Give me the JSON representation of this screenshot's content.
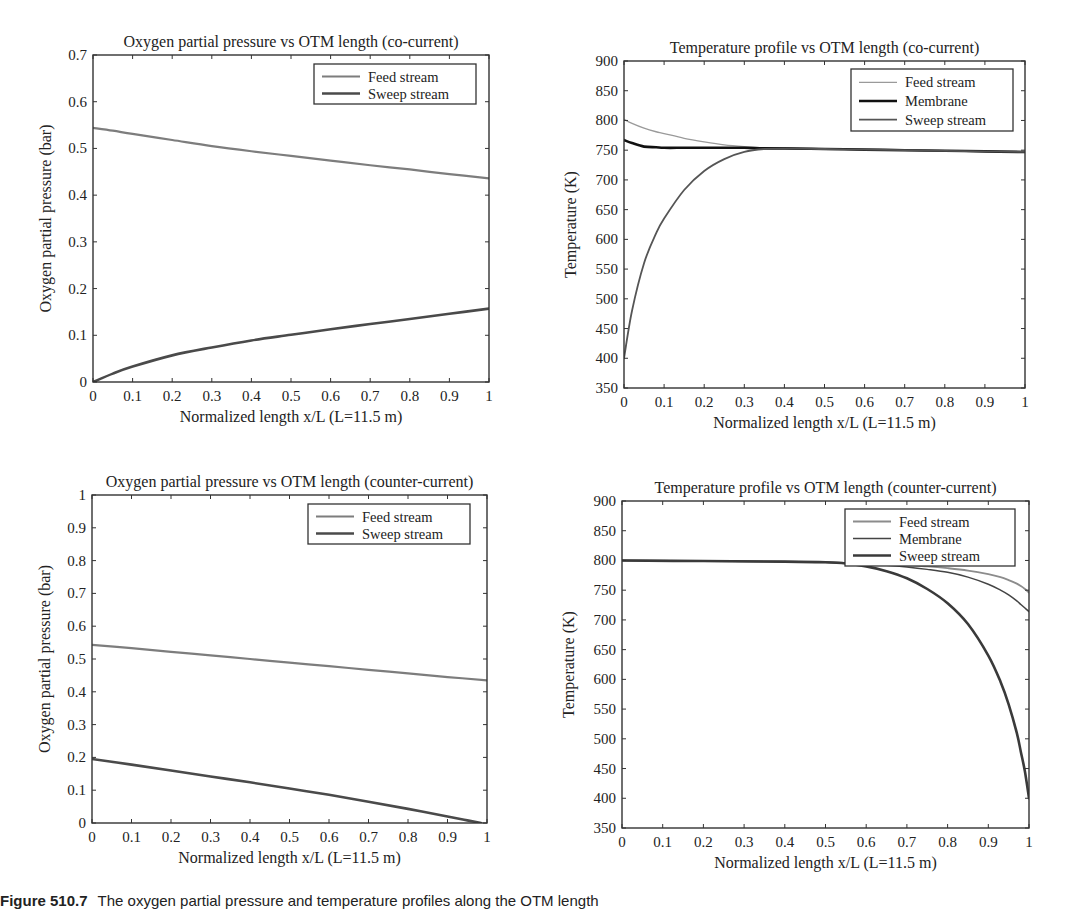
{
  "figure": {
    "caption_label": "Figure 510.7",
    "caption_text": "The oxygen partial pressure and temperature profiles along the OTM length"
  },
  "chart_data": [
    {
      "id": "o2-cocurrent",
      "type": "line",
      "title": "Oxygen partial pressure vs OTM length (co-current)",
      "xlabel": "Normalized length x/L (L=11.5 m)",
      "ylabel": "Oxygen partial pressure (bar)",
      "xlim": [
        0,
        1
      ],
      "ylim": [
        0,
        0.7
      ],
      "xticks": [
        0,
        0.1,
        0.2,
        0.3,
        0.4,
        0.5,
        0.6,
        0.7,
        0.8,
        0.9,
        1
      ],
      "xtick_labels": [
        "0",
        "0.1",
        "0.2",
        "0.3",
        "0.4",
        "0.5",
        "0.6",
        "0.7",
        "0.8",
        "0.9",
        "1"
      ],
      "yticks": [
        0,
        0.1,
        0.2,
        0.3,
        0.4,
        0.5,
        0.6,
        0.7
      ],
      "ytick_labels": [
        "0",
        "0.1",
        "0.2",
        "0.3",
        "0.4",
        "0.5",
        "0.6",
        "0.7"
      ],
      "grid": false,
      "legend_position": "upper right",
      "box": {
        "left": 93,
        "top": 55,
        "right": 489,
        "bottom": 382
      },
      "legend": {
        "x": 314,
        "y": 64,
        "w": 162,
        "h": 40
      },
      "x": [
        0,
        0.05,
        0.1,
        0.2,
        0.3,
        0.4,
        0.5,
        0.6,
        0.7,
        0.8,
        0.9,
        1
      ],
      "series": [
        {
          "name": "Feed stream",
          "color": "#7d7d7d",
          "width": 2.2,
          "values": [
            0.544,
            0.538,
            0.531,
            0.518,
            0.505,
            0.494,
            0.484,
            0.474,
            0.464,
            0.455,
            0.445,
            0.436
          ]
        },
        {
          "name": "Sweep stream",
          "color": "#4a4a4a",
          "width": 2.6,
          "values": [
            0.0,
            0.018,
            0.033,
            0.057,
            0.074,
            0.089,
            0.101,
            0.113,
            0.124,
            0.135,
            0.146,
            0.157
          ]
        }
      ]
    },
    {
      "id": "temp-cocurrent",
      "type": "line",
      "title": "Temperature profile vs OTM length (co-current)",
      "xlabel": "Normalized length x/L (L=11.5 m)",
      "ylabel": "Temperature (K)",
      "xlim": [
        0,
        1
      ],
      "ylim": [
        350,
        900
      ],
      "xticks": [
        0,
        0.1,
        0.2,
        0.3,
        0.4,
        0.5,
        0.6,
        0.7,
        0.8,
        0.9,
        1
      ],
      "xtick_labels": [
        "0",
        "0.1",
        "0.2",
        "0.3",
        "0.4",
        "0.5",
        "0.6",
        "0.7",
        "0.8",
        "0.9",
        "1"
      ],
      "yticks": [
        350,
        400,
        450,
        500,
        550,
        600,
        650,
        700,
        750,
        800,
        850,
        900
      ],
      "ytick_labels": [
        "350",
        "400",
        "450",
        "500",
        "550",
        "600",
        "650",
        "700",
        "750",
        "800",
        "850",
        "900"
      ],
      "grid": false,
      "legend_position": "upper right",
      "box": {
        "left": 624,
        "top": 61,
        "right": 1025,
        "bottom": 388
      },
      "legend": {
        "x": 851,
        "y": 69,
        "w": 162,
        "h": 62
      },
      "x": [
        0,
        0.02,
        0.05,
        0.08,
        0.1,
        0.15,
        0.2,
        0.25,
        0.3,
        0.35,
        0.4,
        0.5,
        0.6,
        0.7,
        0.8,
        0.9,
        1
      ],
      "series": [
        {
          "name": "Feed stream",
          "color": "#9a9a9a",
          "width": 1.3,
          "values": [
            802,
            795,
            787,
            781,
            778,
            770,
            764,
            759,
            756,
            754,
            753,
            752,
            751,
            750,
            749,
            748,
            747
          ]
        },
        {
          "name": "Membrane",
          "color": "#111111",
          "width": 2.6,
          "values": [
            767,
            762,
            756,
            755,
            754,
            754,
            754,
            754,
            754,
            753,
            753,
            752,
            751,
            750,
            749,
            748,
            747
          ]
        },
        {
          "name": "Sweep stream",
          "color": "#555555",
          "width": 1.8,
          "values": [
            400,
            480,
            560,
            610,
            635,
            683,
            715,
            735,
            747,
            752,
            753,
            752,
            751,
            750,
            749,
            748,
            747
          ]
        }
      ]
    },
    {
      "id": "o2-countercurrent",
      "type": "line",
      "title": "Oxygen partial pressure vs OTM length (counter-current)",
      "xlabel": "Normalized length x/L (L=11.5 m)",
      "ylabel": "Oxygen partial pressure (bar)",
      "xlim": [
        0,
        1
      ],
      "ylim": [
        0,
        1
      ],
      "xticks": [
        0,
        0.1,
        0.2,
        0.3,
        0.4,
        0.5,
        0.6,
        0.7,
        0.8,
        0.9,
        1
      ],
      "xtick_labels": [
        "0",
        "0.1",
        "0.2",
        "0.3",
        "0.4",
        "0.5",
        "0.6",
        "0.7",
        "0.8",
        "0.9",
        "1"
      ],
      "yticks": [
        0,
        0.1,
        0.2,
        0.3,
        0.4,
        0.5,
        0.6,
        0.7,
        0.8,
        0.9,
        1
      ],
      "ytick_labels": [
        "0",
        "0.1",
        "0.2",
        "0.3",
        "0.4",
        "0.5",
        "0.6",
        "0.7",
        "0.8",
        "0.9",
        "1"
      ],
      "grid": false,
      "legend_position": "upper right",
      "box": {
        "left": 92,
        "top": 495,
        "right": 487,
        "bottom": 823
      },
      "legend": {
        "x": 308,
        "y": 504,
        "w": 162,
        "h": 40
      },
      "x": [
        0,
        0.1,
        0.2,
        0.3,
        0.4,
        0.5,
        0.6,
        0.7,
        0.8,
        0.9,
        0.95,
        0.985
      ],
      "series": [
        {
          "name": "Feed stream",
          "color": "#7d7d7d",
          "width": 2.2,
          "x": [
            0,
            0.1,
            0.2,
            0.3,
            0.4,
            0.5,
            0.6,
            0.7,
            0.8,
            0.9,
            1
          ],
          "values": [
            0.543,
            0.533,
            0.522,
            0.511,
            0.5,
            0.489,
            0.478,
            0.467,
            0.456,
            0.445,
            0.435
          ]
        },
        {
          "name": "Sweep stream",
          "color": "#4a4a4a",
          "width": 2.6,
          "values": [
            0.195,
            0.178,
            0.16,
            0.142,
            0.124,
            0.105,
            0.086,
            0.065,
            0.043,
            0.02,
            0.008,
            0.0
          ]
        }
      ]
    },
    {
      "id": "temp-countercurrent",
      "type": "line",
      "title": "Temperature profile vs OTM length (counter-current)",
      "xlabel": "Normalized length x/L (L=11.5 m)",
      "ylabel": "Temperature (K)",
      "xlim": [
        0,
        1
      ],
      "ylim": [
        350,
        900
      ],
      "xticks": [
        0,
        0.1,
        0.2,
        0.3,
        0.4,
        0.5,
        0.6,
        0.7,
        0.8,
        0.9,
        1
      ],
      "xtick_labels": [
        "0",
        "0.1",
        "0.2",
        "0.3",
        "0.4",
        "0.5",
        "0.6",
        "0.7",
        "0.8",
        "0.9",
        "1"
      ],
      "yticks": [
        350,
        400,
        450,
        500,
        550,
        600,
        650,
        700,
        750,
        800,
        850,
        900
      ],
      "ytick_labels": [
        "350",
        "400",
        "450",
        "500",
        "550",
        "600",
        "650",
        "700",
        "750",
        "800",
        "850",
        "900"
      ],
      "grid": false,
      "legend_position": "upper right",
      "box": {
        "left": 622,
        "top": 501,
        "right": 1029,
        "bottom": 828
      },
      "legend": {
        "x": 845,
        "y": 509,
        "w": 170,
        "h": 57
      },
      "x": [
        0,
        0.2,
        0.4,
        0.5,
        0.55,
        0.6,
        0.65,
        0.7,
        0.75,
        0.8,
        0.85,
        0.9,
        0.93,
        0.95,
        0.97,
        0.98,
        0.99,
        1
      ],
      "series": [
        {
          "name": "Feed stream",
          "color": "#8c8c8c",
          "width": 1.8,
          "values": [
            800,
            799,
            798,
            797,
            796,
            795,
            794,
            792,
            790,
            787,
            783,
            777,
            772,
            767,
            761,
            757,
            752,
            746
          ]
        },
        {
          "name": "Membrane",
          "color": "#444444",
          "width": 1.5,
          "values": [
            800,
            799,
            798,
            797,
            796,
            794,
            792,
            789,
            785,
            780,
            772,
            760,
            750,
            742,
            732,
            726,
            720,
            714
          ]
        },
        {
          "name": "Sweep stream",
          "color": "#3a3a3a",
          "width": 2.6,
          "values": [
            800,
            799,
            798,
            797,
            795,
            790,
            782,
            770,
            752,
            728,
            693,
            640,
            596,
            558,
            510,
            478,
            445,
            400
          ]
        }
      ]
    }
  ]
}
